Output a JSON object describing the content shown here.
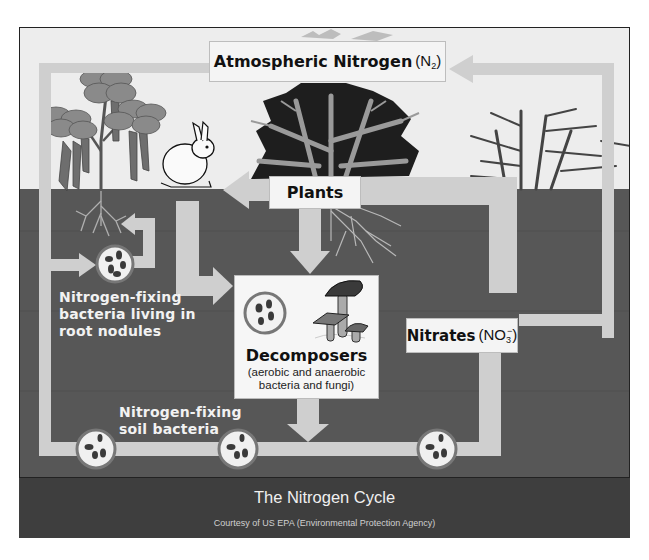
{
  "diagram": {
    "title": "The Nitrogen Cycle",
    "credit": "Courtesy of US EPA (Environmental Protection Agency)",
    "nodes": {
      "atmospheric_nitrogen": {
        "label": "Atmospheric Nitrogen",
        "formula": "N",
        "subscript": "2"
      },
      "plants": {
        "label": "Plants"
      },
      "nitrates": {
        "label": "Nitrates",
        "formula": "NO",
        "subscript": "3",
        "superscript": "−"
      },
      "decomposers": {
        "label": "Decomposers",
        "sublabel_line1": "(aerobic and anaerobic",
        "sublabel_line2": "bacteria and fungi)"
      },
      "root_nodule_bacteria": {
        "line1": "Nitrogen-fixing",
        "line2": "bacteria living in",
        "line3": "root nodules"
      },
      "soil_bacteria": {
        "line1": "Nitrogen-fixing",
        "line2": "soil bacteria"
      }
    },
    "icons": [
      "bean-plant",
      "rabbit",
      "tree",
      "bamboo-tree",
      "mushrooms",
      "bacteria-circle"
    ],
    "colors": {
      "sky": "#ededed",
      "soil": "#575757",
      "arrow_path": "#cfcfcf",
      "label_box": "#f4f4f4",
      "footer": "#3e3e3e",
      "plant_foliage": "#7a7a7a",
      "tree_dark": "#1e1e1e"
    }
  }
}
